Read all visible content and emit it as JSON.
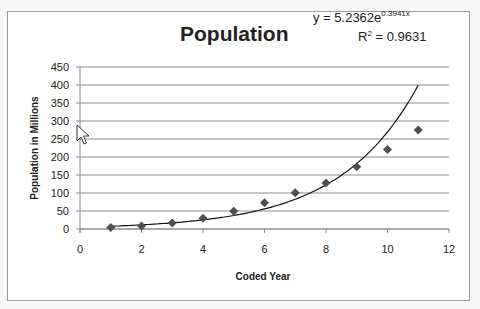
{
  "chart_data": {
    "type": "scatter",
    "title": "Population",
    "xlabel": "Coded Year",
    "ylabel": "Population in Millions",
    "xlim": [
      0,
      12
    ],
    "ylim": [
      0,
      450
    ],
    "x_ticks": [
      "0",
      "2",
      "4",
      "6",
      "8",
      "10",
      "12"
    ],
    "y_ticks": [
      "0",
      "50",
      "100",
      "150",
      "200",
      "250",
      "300",
      "350",
      "400",
      "450"
    ],
    "grid": "horizontal major gridlines",
    "legend": "none",
    "series": [
      {
        "name": "Population",
        "marker": "diamond",
        "x": [
          1,
          2,
          3,
          4,
          5,
          6,
          7,
          8,
          9,
          10,
          11
        ],
        "values": [
          4,
          8,
          17,
          30,
          49,
          73,
          101,
          128,
          173,
          221,
          275
        ]
      }
    ],
    "trendline": {
      "type": "exponential",
      "a": 5.2362,
      "b": 0.3941,
      "x_range": [
        1,
        11
      ],
      "equation_label": "y = 5.2362e",
      "equation_exponent": "0.3941x",
      "r2_label": "R",
      "r2_sup": "2",
      "r2_value": " = 0.9631"
    },
    "colors": {
      "marker": "#4f4f4f",
      "trendline": "#111111",
      "grid": "#8c8c8c",
      "axis": "#8c8c8c"
    }
  }
}
